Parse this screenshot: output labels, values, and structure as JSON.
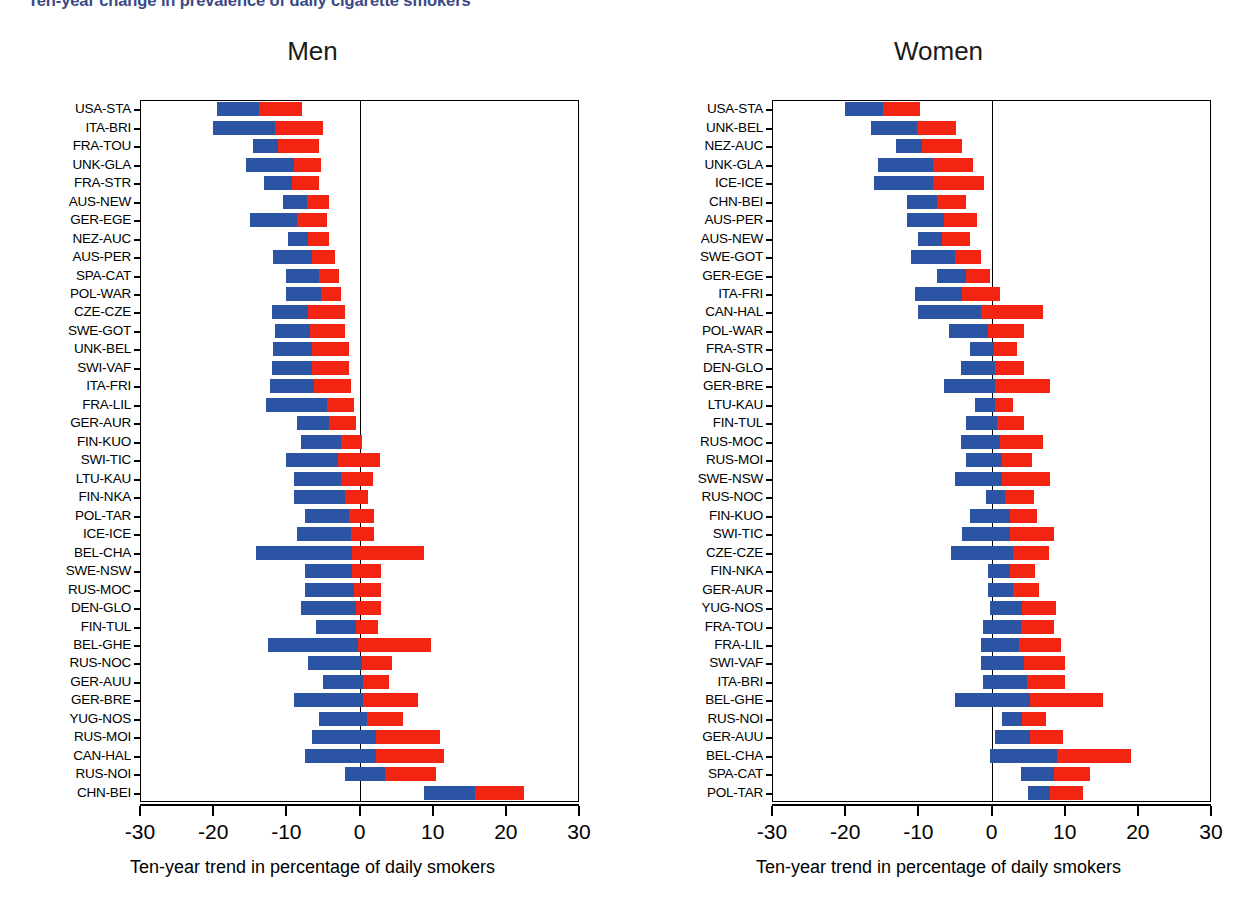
{
  "figure": {
    "title": "Ten-year change in prevalence of daily cigarette smokers",
    "axis_title": "Ten-year trend in percentage of daily smokers",
    "colors": {
      "first_period": "#2b55a4",
      "second_period": "#f42412",
      "title": "#3b4a86"
    },
    "xticks": [
      "-30",
      "-20",
      "-10",
      "0",
      "10",
      "20",
      "30"
    ]
  },
  "chart_data": {
    "type": "bar",
    "orientation": "horizontal",
    "stacked": true,
    "title": "Ten-year change in prevalence of daily cigarette smokers",
    "xlabel": "Ten-year trend in percentage of daily smokers",
    "ylabel": "",
    "xlim": [
      -30,
      30
    ],
    "xticks": [
      -30,
      -20,
      -10,
      0,
      10,
      20,
      30
    ],
    "grid": false,
    "legend_position": "none",
    "series": [
      {
        "name": "first segment",
        "color": "#2b55a4"
      },
      {
        "name": "second segment",
        "color": "#f42412"
      }
    ],
    "panels": [
      {
        "title": "Men",
        "categories": [
          "USA-STA",
          "ITA-BRI",
          "FRA-TOU",
          "UNK-GLA",
          "FRA-STR",
          "AUS-NEW",
          "GER-EGE",
          "NEZ-AUC",
          "AUS-PER",
          "SPA-CAT",
          "POL-WAR",
          "CZE-CZE",
          "SWE-GOT",
          "UNK-BEL",
          "SWI-VAF",
          "ITA-FRI",
          "FRA-LIL",
          "GER-AUR",
          "FIN-KUO",
          "SWI-TIC",
          "LTU-KAU",
          "FIN-NKA",
          "POL-TAR",
          "ICE-ICE",
          "BEL-CHA",
          "SWE-NSW",
          "RUS-MOC",
          "DEN-GLO",
          "FIN-TUL",
          "BEL-GHE",
          "RUS-NOC",
          "GER-AUU",
          "GER-BRE",
          "YUG-NOS",
          "RUS-MOI",
          "CAN-HAL",
          "RUS-NOI",
          "CHN-BEI"
        ],
        "bars": [
          {
            "category": "USA-STA",
            "start": -19.5,
            "split": -13.8,
            "end": -7.8
          },
          {
            "category": "ITA-BRI",
            "start": -20.0,
            "split": -11.5,
            "end": -5.0
          },
          {
            "category": "FRA-TOU",
            "start": -14.5,
            "split": -11.2,
            "end": -5.5
          },
          {
            "category": "UNK-GLA",
            "start": -15.5,
            "split": -9.0,
            "end": -5.2
          },
          {
            "category": "FRA-STR",
            "start": -13.0,
            "split": -9.2,
            "end": -5.5
          },
          {
            "category": "AUS-NEW",
            "start": -10.5,
            "split": -7.2,
            "end": -4.2
          },
          {
            "category": "GER-EGE",
            "start": -15.0,
            "split": -8.5,
            "end": -4.5
          },
          {
            "category": "NEZ-AUC",
            "start": -9.8,
            "split": -7.0,
            "end": -4.2
          },
          {
            "category": "AUS-PER",
            "start": -11.8,
            "split": -6.5,
            "end": -3.3
          },
          {
            "category": "SPA-CAT",
            "start": -10.0,
            "split": -5.5,
            "end": -2.8
          },
          {
            "category": "POL-WAR",
            "start": -10.0,
            "split": -5.2,
            "end": -2.5
          },
          {
            "category": "CZE-CZE",
            "start": -12.0,
            "split": -7.0,
            "end": -2.0
          },
          {
            "category": "SWE-GOT",
            "start": -11.5,
            "split": -6.8,
            "end": -2.0
          },
          {
            "category": "UNK-BEL",
            "start": -11.8,
            "split": -6.5,
            "end": -1.5
          },
          {
            "category": "SWI-VAF",
            "start": -12.0,
            "split": -6.5,
            "end": -1.5
          },
          {
            "category": "ITA-FRI",
            "start": -12.2,
            "split": -6.2,
            "end": -1.2
          },
          {
            "category": "FRA-LIL",
            "start": -12.8,
            "split": -4.5,
            "end": -0.8
          },
          {
            "category": "GER-AUR",
            "start": -8.5,
            "split": -4.2,
            "end": -0.5
          },
          {
            "category": "FIN-KUO",
            "start": -8.0,
            "split": -2.5,
            "end": 0.4
          },
          {
            "category": "SWI-TIC",
            "start": -10.0,
            "split": -3.0,
            "end": 2.8
          },
          {
            "category": "LTU-KAU",
            "start": -9.0,
            "split": -2.5,
            "end": 1.8
          },
          {
            "category": "FIN-NKA",
            "start": -9.0,
            "split": -2.0,
            "end": 1.2
          },
          {
            "category": "POL-TAR",
            "start": -7.5,
            "split": -1.5,
            "end": 2.0
          },
          {
            "category": "ICE-ICE",
            "start": -8.5,
            "split": -1.2,
            "end": 2.0
          },
          {
            "category": "BEL-CHA",
            "start": -14.2,
            "split": -1.0,
            "end": 8.8
          },
          {
            "category": "SWE-NSW",
            "start": -7.5,
            "split": -1.0,
            "end": 3.0
          },
          {
            "category": "RUS-MOC",
            "start": -7.5,
            "split": -0.8,
            "end": 3.0
          },
          {
            "category": "DEN-GLO",
            "start": -8.0,
            "split": -0.5,
            "end": 3.0
          },
          {
            "category": "FIN-TUL",
            "start": -6.0,
            "split": -0.5,
            "end": 2.5
          },
          {
            "category": "BEL-GHE",
            "start": -12.5,
            "split": -0.2,
            "end": 9.8
          },
          {
            "category": "RUS-NOC",
            "start": -7.0,
            "split": 0.4,
            "end": 4.5
          },
          {
            "category": "GER-AUU",
            "start": -5.0,
            "split": 0.5,
            "end": 4.0
          },
          {
            "category": "GER-BRE",
            "start": -9.0,
            "split": 0.5,
            "end": 8.0
          },
          {
            "category": "YUG-NOS",
            "start": -5.5,
            "split": 1.0,
            "end": 6.0
          },
          {
            "category": "RUS-MOI",
            "start": -6.5,
            "split": 2.2,
            "end": 11.0
          },
          {
            "category": "CAN-HAL",
            "start": -7.5,
            "split": 2.2,
            "end": 11.5
          },
          {
            "category": "RUS-NOI",
            "start": -2.0,
            "split": 3.5,
            "end": 10.5
          },
          {
            "category": "CHN-BEI",
            "start": 8.8,
            "split": 15.8,
            "end": 22.5
          }
        ]
      },
      {
        "title": "Women",
        "categories": [
          "USA-STA",
          "UNK-BEL",
          "NEZ-AUC",
          "UNK-GLA",
          "ICE-ICE",
          "CHN-BEI",
          "AUS-PER",
          "AUS-NEW",
          "SWE-GOT",
          "GER-EGE",
          "ITA-FRI",
          "CAN-HAL",
          "POL-WAR",
          "FRA-STR",
          "DEN-GLO",
          "GER-BRE",
          "LTU-KAU",
          "FIN-TUL",
          "RUS-MOC",
          "RUS-MOI",
          "SWE-NSW",
          "RUS-NOC",
          "FIN-KUO",
          "SWI-TIC",
          "CZE-CZE",
          "FIN-NKA",
          "GER-AUR",
          "YUG-NOS",
          "FRA-TOU",
          "FRA-LIL",
          "SWI-VAF",
          "ITA-BRI",
          "BEL-GHE",
          "RUS-NOI",
          "GER-AUU",
          "BEL-CHA",
          "SPA-CAT",
          "POL-TAR"
        ],
        "bars": [
          {
            "category": "USA-STA",
            "start": -20.0,
            "split": -14.8,
            "end": -9.8
          },
          {
            "category": "UNK-BEL",
            "start": -16.5,
            "split": -10.2,
            "end": -4.8
          },
          {
            "category": "NEZ-AUC",
            "start": -13.0,
            "split": -9.5,
            "end": -4.0
          },
          {
            "category": "UNK-GLA",
            "start": -15.5,
            "split": -8.0,
            "end": -2.5
          },
          {
            "category": "ICE-ICE",
            "start": -16.0,
            "split": -8.0,
            "end": -1.0
          },
          {
            "category": "CHN-BEI",
            "start": -11.5,
            "split": -7.5,
            "end": -3.5
          },
          {
            "category": "AUS-PER",
            "start": -11.5,
            "split": -6.5,
            "end": -2.0
          },
          {
            "category": "AUS-NEW",
            "start": -10.0,
            "split": -6.8,
            "end": -3.0
          },
          {
            "category": "SWE-GOT",
            "start": -11.0,
            "split": -5.0,
            "end": -1.5
          },
          {
            "category": "GER-EGE",
            "start": -7.5,
            "split": -3.5,
            "end": -0.2
          },
          {
            "category": "ITA-FRI",
            "start": -10.5,
            "split": -4.0,
            "end": 1.2
          },
          {
            "category": "CAN-HAL",
            "start": -10.0,
            "split": -1.5,
            "end": 7.0
          },
          {
            "category": "POL-WAR",
            "start": -5.8,
            "split": -0.5,
            "end": 4.5
          },
          {
            "category": "FRA-STR",
            "start": -3.0,
            "split": 0.3,
            "end": 3.5
          },
          {
            "category": "DEN-GLO",
            "start": -4.2,
            "split": 0.5,
            "end": 4.5
          },
          {
            "category": "GER-BRE",
            "start": -6.5,
            "split": 0.5,
            "end": 8.0
          },
          {
            "category": "LTU-KAU",
            "start": -2.2,
            "split": 0.5,
            "end": 3.0
          },
          {
            "category": "FIN-TUL",
            "start": -3.5,
            "split": 0.8,
            "end": 4.5
          },
          {
            "category": "RUS-MOC",
            "start": -4.2,
            "split": 1.2,
            "end": 7.0
          },
          {
            "category": "RUS-MOI",
            "start": -3.5,
            "split": 1.5,
            "end": 5.5
          },
          {
            "category": "SWE-NSW",
            "start": -5.0,
            "split": 1.5,
            "end": 8.0
          },
          {
            "category": "RUS-NOC",
            "start": -0.8,
            "split": 1.8,
            "end": 5.8
          },
          {
            "category": "FIN-KUO",
            "start": -3.0,
            "split": 2.5,
            "end": 6.2
          },
          {
            "category": "SWI-TIC",
            "start": -4.0,
            "split": 2.5,
            "end": 8.5
          },
          {
            "category": "CZE-CZE",
            "start": -5.5,
            "split": 3.0,
            "end": 7.8
          },
          {
            "category": "FIN-NKA",
            "start": -0.5,
            "split": 2.5,
            "end": 6.0
          },
          {
            "category": "GER-AUR",
            "start": -0.5,
            "split": 3.0,
            "end": 6.5
          },
          {
            "category": "YUG-NOS",
            "start": -0.2,
            "split": 4.2,
            "end": 8.8
          },
          {
            "category": "FRA-TOU",
            "start": -1.2,
            "split": 4.0,
            "end": 8.5
          },
          {
            "category": "FRA-LIL",
            "start": -1.5,
            "split": 3.8,
            "end": 9.5
          },
          {
            "category": "SWI-VAF",
            "start": -1.5,
            "split": 4.5,
            "end": 10.0
          },
          {
            "category": "ITA-BRI",
            "start": -1.2,
            "split": 4.8,
            "end": 10.0
          },
          {
            "category": "BEL-GHE",
            "start": -5.0,
            "split": 5.2,
            "end": 15.2
          },
          {
            "category": "RUS-NOI",
            "start": 1.5,
            "split": 4.2,
            "end": 7.5
          },
          {
            "category": "GER-AUU",
            "start": 0.5,
            "split": 5.2,
            "end": 9.8
          },
          {
            "category": "BEL-CHA",
            "start": -0.2,
            "split": 9.0,
            "end": 19.0
          },
          {
            "category": "SPA-CAT",
            "start": 4.0,
            "split": 8.5,
            "end": 13.5
          },
          {
            "category": "POL-TAR",
            "start": 5.0,
            "split": 8.0,
            "end": 12.5
          }
        ]
      }
    ]
  }
}
